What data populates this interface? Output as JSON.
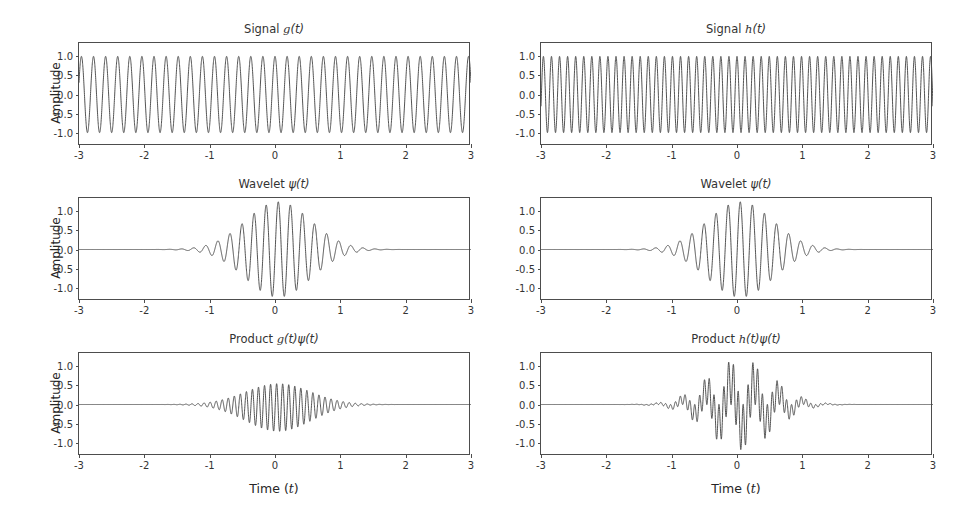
{
  "figure": {
    "background": "#ffffff",
    "line_color": "#4a4a4a",
    "axis_color": "#4d4d4d",
    "text_color": "#333333",
    "rows": 3,
    "cols": 2
  },
  "axis_labels": {
    "y": "Amplitude",
    "x_prefix": "Time (",
    "x_var": "t",
    "x_suffix": ")"
  },
  "ticks": {
    "x": [
      "-3",
      "-2",
      "-1",
      "0",
      "1",
      "2",
      "3"
    ],
    "x_values": [
      -3,
      -2,
      -1,
      0,
      1,
      2,
      3
    ],
    "y": [
      "-1.0",
      "-0.5",
      "0.0",
      "0.5",
      "1.0"
    ],
    "y_values": [
      -1.0,
      -0.5,
      0.0,
      0.5,
      1.0
    ]
  },
  "panels": [
    {
      "id": "signal-g",
      "title_prefix": "Signal ",
      "title_var": "g",
      "title_suffix": "(t)",
      "row": 0,
      "col": 0
    },
    {
      "id": "signal-h",
      "title_prefix": "Signal ",
      "title_var": "h",
      "title_suffix": "(t)",
      "row": 0,
      "col": 1
    },
    {
      "id": "wavelet-l",
      "title_prefix": "Wavelet ",
      "title_var": "ψ",
      "title_suffix": "(t)",
      "row": 1,
      "col": 0
    },
    {
      "id": "wavelet-r",
      "title_prefix": "Wavelet ",
      "title_var": "ψ",
      "title_suffix": "(t)",
      "row": 1,
      "col": 1
    },
    {
      "id": "product-g",
      "title_prefix": "Product ",
      "title_var": "g",
      "title_suffix": "(t)ψ(t)",
      "row": 2,
      "col": 0
    },
    {
      "id": "product-h",
      "title_prefix": "Product ",
      "title_var": "h",
      "title_suffix": "(t)ψ(t)",
      "row": 2,
      "col": 1
    }
  ],
  "chart_data": [
    {
      "type": "line",
      "id": "signal-g",
      "title": "Signal g(t)",
      "xlabel": "",
      "ylabel": "Amplitude",
      "xlim": [
        -3,
        3
      ],
      "ylim": [
        -1.35,
        1.35
      ],
      "grid": false,
      "legend": "none",
      "series": [
        {
          "name": "g(t)",
          "form": "cos",
          "amplitude": 1.0,
          "freq_cycles_per_unit": 5.4,
          "phase": 0.0,
          "color": "#4a4a4a"
        }
      ]
    },
    {
      "type": "line",
      "id": "signal-h",
      "title": "Signal h(t)",
      "xlabel": "",
      "ylabel": "",
      "xlim": [
        -3,
        3
      ],
      "ylim": [
        -1.35,
        1.35
      ],
      "grid": false,
      "legend": "none",
      "series": [
        {
          "name": "h(t)",
          "form": "cos",
          "amplitude": 1.0,
          "freq_cycles_per_unit": 8.1,
          "phase": 0.0,
          "color": "#4a4a4a"
        }
      ]
    },
    {
      "type": "line",
      "id": "wavelet-l",
      "title": "Wavelet ψ(t)",
      "xlabel": "",
      "ylabel": "Amplitude",
      "xlim": [
        -3,
        3
      ],
      "ylim": [
        -1.35,
        1.35
      ],
      "grid": false,
      "legend": "none",
      "series": [
        {
          "name": "ψ(t)",
          "form": "morlet",
          "amplitude": 1.25,
          "freq_cycles_per_unit": 5.4,
          "sigma": 0.5,
          "center": 0.05,
          "color": "#4a4a4a"
        }
      ]
    },
    {
      "type": "line",
      "id": "wavelet-r",
      "title": "Wavelet ψ(t)",
      "xlabel": "",
      "ylabel": "",
      "xlim": [
        -3,
        3
      ],
      "ylim": [
        -1.35,
        1.35
      ],
      "grid": false,
      "legend": "none",
      "series": [
        {
          "name": "ψ(t)",
          "form": "morlet",
          "amplitude": 1.25,
          "freq_cycles_per_unit": 5.4,
          "sigma": 0.5,
          "center": 0.05,
          "color": "#4a4a4a"
        }
      ]
    },
    {
      "type": "line",
      "id": "product-g",
      "title": "Product g(t)ψ(t)",
      "xlabel": "Time (t)",
      "ylabel": "Amplitude",
      "xlim": [
        -3,
        3
      ],
      "ylim": [
        -1.35,
        1.35
      ],
      "grid": false,
      "legend": "none",
      "series": [
        {
          "name": "g(t)ψ(t)",
          "form": "product",
          "factor_a": "cos",
          "factor_a_freq": 5.4,
          "factor_b": "morlet",
          "factor_b_freq": 5.4,
          "amplitude": 1.25,
          "sigma": 0.5,
          "center": 0.05,
          "color": "#4a4a4a",
          "note": "rectified: envelope positive, matched frequencies"
        }
      ]
    },
    {
      "type": "line",
      "id": "product-h",
      "title": "Product h(t)ψ(t)",
      "xlabel": "Time (t)",
      "ylabel": "",
      "xlim": [
        -3,
        3
      ],
      "ylim": [
        -1.35,
        1.35
      ],
      "grid": false,
      "legend": "none",
      "series": [
        {
          "name": "h(t)ψ(t)",
          "form": "product",
          "factor_a": "cos",
          "factor_a_freq": 8.1,
          "factor_b": "morlet",
          "factor_b_freq": 5.4,
          "amplitude": 1.25,
          "sigma": 0.5,
          "center": 0.05,
          "color": "#4a4a4a",
          "note": "beating: oscillates about zero, mismatched frequencies"
        }
      ]
    }
  ]
}
